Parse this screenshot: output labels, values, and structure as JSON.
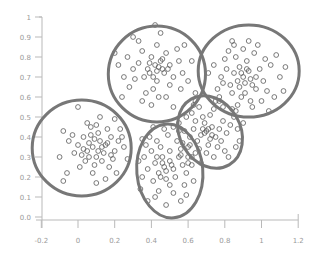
{
  "chart_data": {
    "type": "scatter",
    "title": "",
    "xlabel": "",
    "ylabel": "",
    "xlim": [
      -0.2,
      1.2
    ],
    "ylim": [
      0.0,
      1.0
    ],
    "grid": false,
    "legend": null,
    "x_ticks": [
      "-0.2",
      "0",
      "0.2",
      "0.4",
      "0.6",
      "0.8",
      "1",
      "1.2"
    ],
    "x_tick_values": [
      -0.2,
      0,
      0.2,
      0.4,
      0.6,
      0.8,
      1.0,
      1.2
    ],
    "y_ticks": [
      "0.0",
      "0.1",
      "0.2",
      "0.3",
      "0.4",
      "0.5",
      "0.6",
      "0.7",
      "0.8",
      "0.9",
      "1"
    ],
    "y_tick_values": [
      0.0,
      0.1,
      0.2,
      0.3,
      0.4,
      0.5,
      0.6,
      0.7,
      0.8,
      0.9,
      1.0
    ],
    "marker": "open-circle",
    "marker_color": "#5a5a5a",
    "ellipse_color": "#777777",
    "clusters": [
      {
        "name": "cluster-left",
        "center": [
          0.08,
          0.35
        ],
        "ellipse": {
          "cx": 0.02,
          "cy": 0.345,
          "rx": 0.27,
          "ry": 0.24,
          "angle": 0
        },
        "points": [
          [
            0.08,
            0.35
          ],
          [
            0.12,
            0.38
          ],
          [
            0.05,
            0.33
          ],
          [
            0.15,
            0.36
          ],
          [
            0.1,
            0.3
          ],
          [
            0.02,
            0.31
          ],
          [
            0.18,
            0.4
          ],
          [
            0.07,
            0.41
          ],
          [
            0.13,
            0.28
          ],
          [
            0.0,
            0.36
          ],
          [
            0.2,
            0.33
          ],
          [
            0.09,
            0.26
          ],
          [
            0.16,
            0.44
          ],
          [
            0.04,
            0.28
          ],
          [
            0.11,
            0.42
          ],
          [
            -0.02,
            0.32
          ],
          [
            0.22,
            0.38
          ],
          [
            0.06,
            0.37
          ],
          [
            0.14,
            0.32
          ],
          [
            0.03,
            0.4
          ],
          [
            0.19,
            0.29
          ],
          [
            0.1,
            0.46
          ],
          [
            -0.05,
            0.38
          ],
          [
            0.17,
            0.25
          ],
          [
            0.01,
            0.25
          ],
          [
            0.25,
            0.35
          ],
          [
            0.08,
            0.22
          ],
          [
            -0.08,
            0.43
          ],
          [
            0.12,
            0.5
          ],
          [
            0.23,
            0.44
          ],
          [
            -0.1,
            0.3
          ],
          [
            -0.06,
            0.22
          ],
          [
            0.05,
            0.47
          ],
          [
            0.21,
            0.22
          ],
          [
            0.15,
            0.19
          ],
          [
            -0.08,
            0.18
          ],
          [
            0.0,
            0.55
          ],
          [
            0.1,
            0.17
          ],
          [
            0.27,
            0.29
          ],
          [
            0.2,
            0.49
          ],
          [
            0.13,
            0.35
          ],
          [
            0.09,
            0.39
          ],
          [
            0.06,
            0.3
          ],
          [
            0.16,
            0.37
          ],
          [
            0.11,
            0.33
          ],
          [
            -0.03,
            0.41
          ],
          [
            0.18,
            0.31
          ],
          [
            0.03,
            0.34
          ],
          [
            0.07,
            0.45
          ],
          [
            0.24,
            0.4
          ]
        ]
      },
      {
        "name": "cluster-top",
        "center": [
          0.42,
          0.76
        ],
        "ellipse": {
          "cx": 0.43,
          "cy": 0.715,
          "rx": 0.265,
          "ry": 0.24,
          "angle": 0
        },
        "points": [
          [
            0.42,
            0.76
          ],
          [
            0.45,
            0.78
          ],
          [
            0.38,
            0.74
          ],
          [
            0.47,
            0.72
          ],
          [
            0.4,
            0.8
          ],
          [
            0.36,
            0.7
          ],
          [
            0.5,
            0.76
          ],
          [
            0.43,
            0.68
          ],
          [
            0.33,
            0.77
          ],
          [
            0.48,
            0.82
          ],
          [
            0.41,
            0.64
          ],
          [
            0.52,
            0.7
          ],
          [
            0.35,
            0.83
          ],
          [
            0.44,
            0.6
          ],
          [
            0.39,
            0.72
          ],
          [
            0.46,
            0.74
          ],
          [
            0.3,
            0.74
          ],
          [
            0.55,
            0.78
          ],
          [
            0.43,
            0.86
          ],
          [
            0.5,
            0.66
          ],
          [
            0.27,
            0.8
          ],
          [
            0.57,
            0.72
          ],
          [
            0.37,
            0.62
          ],
          [
            0.54,
            0.84
          ],
          [
            0.25,
            0.7
          ],
          [
            0.6,
            0.68
          ],
          [
            0.4,
            0.56
          ],
          [
            0.48,
            0.6
          ],
          [
            0.33,
            0.88
          ],
          [
            0.58,
            0.86
          ],
          [
            0.22,
            0.76
          ],
          [
            0.62,
            0.78
          ],
          [
            0.45,
            0.92
          ],
          [
            0.28,
            0.65
          ],
          [
            0.52,
            0.55
          ],
          [
            0.35,
            0.58
          ],
          [
            0.64,
            0.62
          ],
          [
            0.2,
            0.82
          ],
          [
            0.43,
            0.73
          ],
          [
            0.41,
            0.7
          ],
          [
            0.46,
            0.79
          ],
          [
            0.39,
            0.77
          ],
          [
            0.44,
            0.75
          ],
          [
            0.49,
            0.74
          ],
          [
            0.31,
            0.69
          ],
          [
            0.56,
            0.64
          ],
          [
            0.24,
            0.6
          ],
          [
            0.63,
            0.56
          ],
          [
            0.42,
            0.96
          ],
          [
            0.3,
            0.9
          ]
        ]
      },
      {
        "name": "cluster-top-right",
        "center": [
          0.9,
          0.7
        ],
        "ellipse": {
          "cx": 0.93,
          "cy": 0.73,
          "rx": 0.275,
          "ry": 0.23,
          "angle": 0
        },
        "points": [
          [
            0.9,
            0.7
          ],
          [
            0.93,
            0.73
          ],
          [
            0.87,
            0.68
          ],
          [
            0.95,
            0.66
          ],
          [
            0.88,
            0.75
          ],
          [
            0.91,
            0.62
          ],
          [
            0.85,
            0.72
          ],
          [
            0.97,
            0.7
          ],
          [
            0.92,
            0.78
          ],
          [
            0.83,
            0.66
          ],
          [
            0.99,
            0.74
          ],
          [
            0.89,
            0.6
          ],
          [
            0.86,
            0.8
          ],
          [
            1.01,
            0.68
          ],
          [
            0.94,
            0.58
          ],
          [
            0.81,
            0.74
          ],
          [
            0.96,
            0.82
          ],
          [
            0.84,
            0.62
          ],
          [
            1.03,
            0.63
          ],
          [
            0.9,
            0.84
          ],
          [
            0.78,
            0.7
          ],
          [
            1.05,
            0.76
          ],
          [
            0.87,
            0.56
          ],
          [
            0.8,
            0.79
          ],
          [
            1.07,
            0.6
          ],
          [
            0.93,
            0.88
          ],
          [
            0.76,
            0.64
          ],
          [
            1.0,
            0.58
          ],
          [
            0.85,
            0.86
          ],
          [
            1.1,
            0.7
          ],
          [
            0.74,
            0.76
          ],
          [
            0.98,
            0.86
          ],
          [
            1.12,
            0.63
          ],
          [
            0.91,
            0.67
          ],
          [
            0.89,
            0.72
          ],
          [
            0.94,
            0.69
          ],
          [
            0.88,
            0.65
          ],
          [
            0.92,
            0.74
          ],
          [
            1.08,
            0.81
          ],
          [
            0.77,
            0.58
          ],
          [
            0.95,
            0.55
          ],
          [
            1.02,
            0.79
          ],
          [
            0.82,
            0.83
          ],
          [
            1.13,
            0.75
          ],
          [
            0.86,
            0.53
          ],
          [
            0.97,
            0.64
          ],
          [
            0.79,
            0.67
          ],
          [
            0.84,
            0.88
          ],
          [
            1.04,
            0.53
          ],
          [
            0.71,
            0.72
          ]
        ]
      },
      {
        "name": "cluster-bottom-middle",
        "center": [
          0.47,
          0.25
        ],
        "ellipse": {
          "cx": 0.5,
          "cy": 0.23,
          "rx": 0.18,
          "ry": 0.235,
          "angle": -5
        },
        "points": [
          [
            0.47,
            0.25
          ],
          [
            0.5,
            0.28
          ],
          [
            0.44,
            0.22
          ],
          [
            0.52,
            0.24
          ],
          [
            0.46,
            0.3
          ],
          [
            0.42,
            0.27
          ],
          [
            0.55,
            0.3
          ],
          [
            0.48,
            0.19
          ],
          [
            0.4,
            0.33
          ],
          [
            0.53,
            0.2
          ],
          [
            0.45,
            0.35
          ],
          [
            0.5,
            0.16
          ],
          [
            0.38,
            0.24
          ],
          [
            0.57,
            0.26
          ],
          [
            0.43,
            0.38
          ],
          [
            0.56,
            0.34
          ],
          [
            0.41,
            0.18
          ],
          [
            0.49,
            0.41
          ],
          [
            0.36,
            0.3
          ],
          [
            0.59,
            0.22
          ],
          [
            0.44,
            0.13
          ],
          [
            0.54,
            0.38
          ],
          [
            0.35,
            0.2
          ],
          [
            0.6,
            0.3
          ],
          [
            0.39,
            0.4
          ],
          [
            0.52,
            0.12
          ],
          [
            0.37,
            0.36
          ],
          [
            0.58,
            0.16
          ],
          [
            0.47,
            0.44
          ],
          [
            0.34,
            0.14
          ],
          [
            0.62,
            0.26
          ],
          [
            0.42,
            0.1
          ],
          [
            0.55,
            0.43
          ],
          [
            0.33,
            0.28
          ],
          [
            0.48,
            0.23
          ],
          [
            0.46,
            0.27
          ],
          [
            0.51,
            0.26
          ],
          [
            0.45,
            0.2
          ],
          [
            0.5,
            0.33
          ],
          [
            0.43,
            0.3
          ],
          [
            0.56,
            0.08
          ],
          [
            0.48,
            0.06
          ],
          [
            0.61,
            0.36
          ],
          [
            0.38,
            0.08
          ],
          [
            0.63,
            0.18
          ],
          [
            0.52,
            0.45
          ],
          [
            0.35,
            0.39
          ],
          [
            0.59,
            0.11
          ],
          [
            0.41,
            0.45
          ],
          [
            0.64,
            0.32
          ]
        ]
      },
      {
        "name": "cluster-middle-right",
        "center": [
          0.7,
          0.43
        ],
        "ellipse": {
          "cx": 0.72,
          "cy": 0.425,
          "rx": 0.165,
          "ry": 0.19,
          "angle": -30
        },
        "points": [
          [
            0.7,
            0.43
          ],
          [
            0.73,
            0.45
          ],
          [
            0.67,
            0.41
          ],
          [
            0.75,
            0.4
          ],
          [
            0.69,
            0.47
          ],
          [
            0.65,
            0.38
          ],
          [
            0.77,
            0.44
          ],
          [
            0.71,
            0.36
          ],
          [
            0.63,
            0.44
          ],
          [
            0.79,
            0.48
          ],
          [
            0.72,
            0.51
          ],
          [
            0.66,
            0.34
          ],
          [
            0.81,
            0.42
          ],
          [
            0.68,
            0.5
          ],
          [
            0.61,
            0.4
          ],
          [
            0.76,
            0.35
          ],
          [
            0.74,
            0.54
          ],
          [
            0.6,
            0.35
          ],
          [
            0.83,
            0.46
          ],
          [
            0.64,
            0.48
          ],
          [
            0.78,
            0.38
          ],
          [
            0.7,
            0.32
          ],
          [
            0.58,
            0.43
          ],
          [
            0.85,
            0.5
          ],
          [
            0.66,
            0.55
          ],
          [
            0.8,
            0.33
          ],
          [
            0.57,
            0.37
          ],
          [
            0.75,
            0.58
          ],
          [
            0.87,
            0.44
          ],
          [
            0.62,
            0.3
          ],
          [
            0.71,
            0.44
          ],
          [
            0.69,
            0.42
          ],
          [
            0.73,
            0.41
          ],
          [
            0.68,
            0.44
          ],
          [
            0.72,
            0.39
          ],
          [
            0.84,
            0.54
          ],
          [
            0.59,
            0.5
          ],
          [
            0.88,
            0.38
          ],
          [
            0.64,
            0.58
          ],
          [
            0.82,
            0.3
          ],
          [
            0.56,
            0.31
          ],
          [
            0.77,
            0.6
          ],
          [
            0.9,
            0.47
          ],
          [
            0.67,
            0.27
          ],
          [
            0.55,
            0.47
          ],
          [
            0.79,
            0.55
          ],
          [
            0.62,
            0.52
          ],
          [
            0.86,
            0.35
          ],
          [
            0.74,
            0.3
          ],
          [
            0.6,
            0.27
          ]
        ]
      }
    ]
  }
}
